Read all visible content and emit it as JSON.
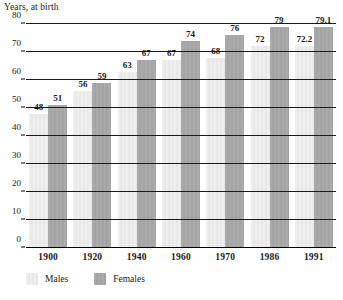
{
  "chart_data": {
    "type": "bar",
    "title": "Years, at birth",
    "xlabel": "",
    "ylabel": "Years, at birth",
    "categories": [
      "1900",
      "1920",
      "1940",
      "1960",
      "1970",
      "1986",
      "1991"
    ],
    "series": [
      {
        "name": "Males",
        "color": "#ededed",
        "values": [
          48,
          56,
          63,
          67,
          68,
          72,
          72.2
        ],
        "labels": [
          "48",
          "56",
          "63",
          "67",
          "68",
          "72",
          "72.2"
        ]
      },
      {
        "name": "Females",
        "color": "#a8a8a8",
        "values": [
          51,
          59,
          67,
          74,
          76,
          79,
          79.1
        ],
        "labels": [
          "51",
          "59",
          "67",
          "74",
          "76",
          "79",
          "79.1"
        ]
      }
    ],
    "ylim": [
      0,
      80
    ],
    "yticks": [
      0,
      10,
      20,
      30,
      40,
      50,
      60,
      70,
      80
    ],
    "ytick_labels": [
      "0",
      "10",
      "20",
      "30",
      "40",
      "50",
      "60",
      "70",
      "80"
    ],
    "grid": true,
    "grid_axis": "y",
    "legend_position": "bottom-left",
    "data_labels": true
  },
  "legend": {
    "items": [
      {
        "label": "Males",
        "swatch": "males"
      },
      {
        "label": "Females",
        "swatch": "females"
      }
    ]
  }
}
